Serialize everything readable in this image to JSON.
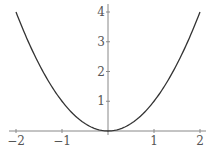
{
  "chart_data": {
    "type": "line",
    "title": "",
    "xlabel": "",
    "ylabel": "",
    "function": "y = x^2",
    "xlim": [
      -2,
      2
    ],
    "ylim": [
      0,
      4
    ],
    "grid": false,
    "legend": null,
    "x_ticks": [
      -2,
      -1,
      1,
      2
    ],
    "x_tick_labels": [
      "−2",
      "−1",
      "1",
      "2"
    ],
    "y_ticks": [
      1,
      2,
      3,
      4
    ],
    "y_tick_labels": [
      "1",
      "2",
      "3",
      "4"
    ],
    "series": [
      {
        "name": "x^2",
        "color": "#333333",
        "x": [
          -2,
          -1.75,
          -1.5,
          -1.25,
          -1,
          -0.75,
          -0.5,
          -0.25,
          0,
          0.25,
          0.5,
          0.75,
          1,
          1.25,
          1.5,
          1.75,
          2
        ],
        "y": [
          4,
          3.0625,
          2.25,
          1.5625,
          1,
          0.5625,
          0.25,
          0.0625,
          0,
          0.0625,
          0.25,
          0.5625,
          1,
          1.5625,
          2.25,
          3.0625,
          4
        ]
      }
    ]
  },
  "layout": {
    "origin_px": [
      108,
      131
    ],
    "x_unit_px": 46,
    "y_unit_px": 29.75,
    "axis_color": "#888888",
    "label_color": "#555555",
    "curve_color": "#333333"
  }
}
